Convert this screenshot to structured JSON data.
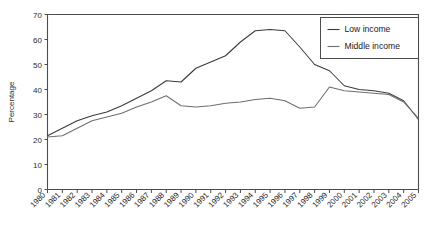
{
  "chart_data": {
    "type": "line",
    "title": "",
    "xlabel": "",
    "ylabel": "Percentage",
    "ylim": [
      0,
      70
    ],
    "ytick_step": 10,
    "yticks": [
      0,
      10,
      20,
      30,
      40,
      50,
      60,
      70
    ],
    "grid": false,
    "legend_position": "top-right",
    "categories": [
      "1980",
      "1981",
      "1982",
      "1983",
      "1984",
      "1985",
      "1986",
      "1987",
      "1988",
      "1989",
      "1990",
      "1991",
      "1992",
      "1993",
      "1994",
      "1995",
      "1996",
      "1997",
      "1998",
      "1999",
      "2000",
      "2001",
      "2002",
      "2003",
      "2004",
      "2005"
    ],
    "series": [
      {
        "name": "Low income",
        "color": "#3a3a3a",
        "values": [
          21.5,
          24.5,
          27.5,
          29.5,
          31.0,
          33.5,
          36.5,
          39.5,
          43.5,
          43.0,
          48.5,
          51.0,
          53.5,
          59.0,
          63.5,
          64.0,
          63.5,
          57.0,
          50.0,
          47.5,
          41.5,
          40.0,
          39.5,
          38.5,
          35.5,
          28.0
        ]
      },
      {
        "name": "Middle income",
        "color": "#6e6e6e",
        "values": [
          21.0,
          21.5,
          24.5,
          27.5,
          29.0,
          30.5,
          33.0,
          35.0,
          37.5,
          33.5,
          33.0,
          33.5,
          34.5,
          35.0,
          36.0,
          36.5,
          35.5,
          32.5,
          33.0,
          41.0,
          39.5,
          39.0,
          38.5,
          38.0,
          35.0,
          28.5
        ]
      }
    ]
  },
  "legend": {
    "entries": [
      {
        "label": "Low income"
      },
      {
        "label": "Middle income"
      }
    ]
  }
}
